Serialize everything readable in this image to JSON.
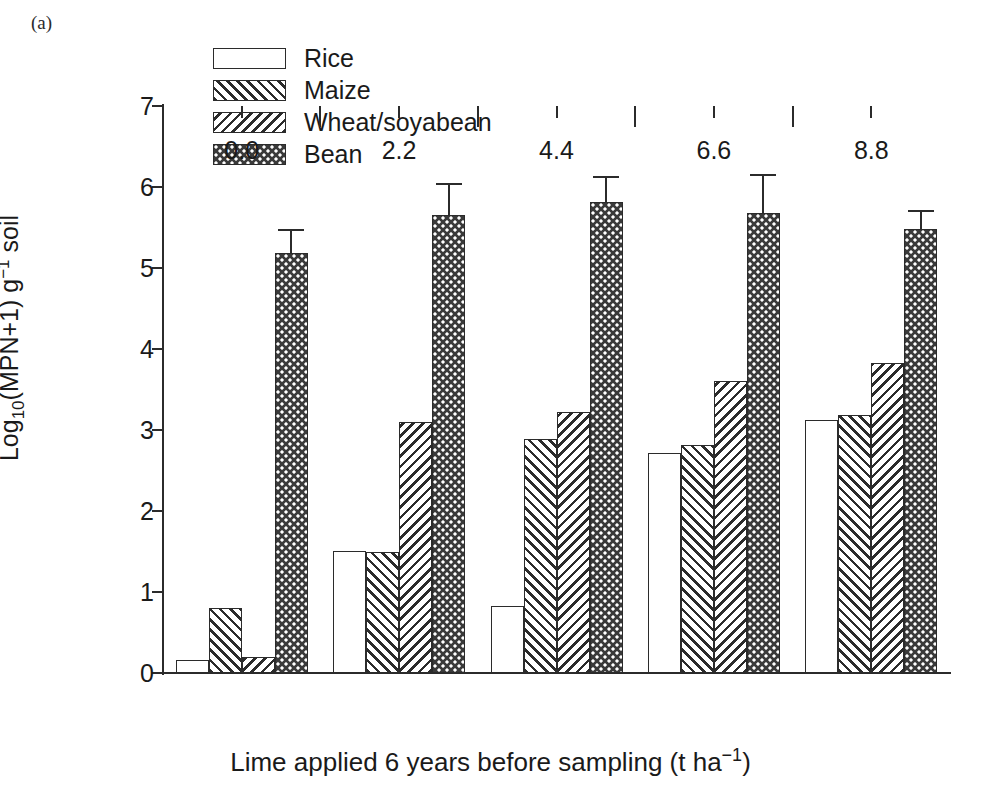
{
  "panel": {
    "label": "(a)"
  },
  "legend": {
    "position": "top-center",
    "entries": [
      {
        "label": "Rice",
        "pattern": "solid-white"
      },
      {
        "label": "Maize",
        "pattern": "forward-diagonal-hatch"
      },
      {
        "label": "Wheat/soyabean",
        "pattern": "backward-diagonal-hatch"
      },
      {
        "label": "Bean",
        "pattern": "dense-checkered-dots"
      }
    ]
  },
  "axes": {
    "y_title_parts": {
      "pre": "Log",
      "sub": "10",
      "mid": "(MPN+1) g",
      "sup": "−1",
      "post": " soil"
    },
    "x_title_parts": {
      "pre": "Lime applied 6 years before sampling (t ha",
      "sup": "−1",
      "post": ")"
    },
    "y_ticks": [
      "0",
      "1",
      "2",
      "3",
      "4",
      "5",
      "6",
      "7"
    ],
    "x_ticks": [
      "0.0",
      "2.2",
      "4.4",
      "6.6",
      "8.8"
    ]
  },
  "colors": {
    "ink": "#2b2b2b",
    "background": "#ffffff",
    "bean_fill": "#3a3a3a"
  },
  "chart_data": {
    "type": "bar",
    "title": "(a)",
    "xlabel": "Lime applied 6 years before sampling (t ha−1)",
    "ylabel": "Log10 (MPN+1) g−1 soil",
    "ylim": [
      0,
      7
    ],
    "ytick_step": 1,
    "grid": false,
    "legend_position": "top-center",
    "categories": [
      "0.0",
      "2.2",
      "4.4",
      "6.6",
      "8.8"
    ],
    "series": [
      {
        "name": "Rice",
        "values": [
          0.16,
          1.51,
          0.83,
          2.72,
          3.12
        ],
        "errors": [
          null,
          null,
          null,
          null,
          null
        ]
      },
      {
        "name": "Maize",
        "values": [
          0.8,
          1.5,
          2.89,
          2.81,
          3.18
        ],
        "errors": [
          null,
          null,
          null,
          null,
          null
        ]
      },
      {
        "name": "Wheat/soyabean",
        "values": [
          0.2,
          3.1,
          3.22,
          3.6,
          3.83
        ],
        "errors": [
          null,
          null,
          null,
          null,
          null
        ]
      },
      {
        "name": "Bean",
        "values": [
          5.18,
          5.65,
          5.82,
          5.68,
          5.48
        ],
        "errors": [
          0.3,
          0.4,
          0.32,
          0.48,
          0.24
        ]
      }
    ]
  }
}
